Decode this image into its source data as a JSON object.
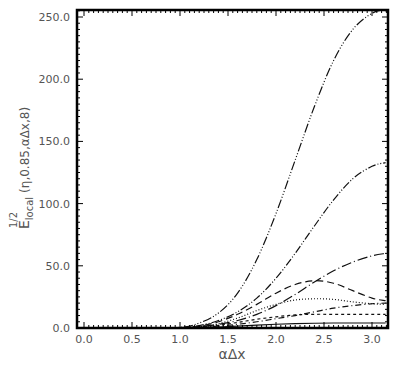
{
  "chart_data": {
    "type": "line",
    "title": "",
    "xlabel": "αΔx",
    "ylabel": {
      "base": "E",
      "superscript": "1/2",
      "subscript": "local",
      "args": "(η,0.85,αΔx,8)"
    },
    "xlim": [
      0,
      3.1416
    ],
    "ylim": [
      0,
      260
    ],
    "xticks": [
      0.0,
      0.5,
      1.0,
      1.5,
      2.0,
      2.5,
      3.0
    ],
    "xtick_labels": [
      "0.0",
      "0.5",
      "1.0",
      "1.5",
      "2.0",
      "2.5",
      "3.0"
    ],
    "yticks": [
      0,
      50,
      100,
      150,
      200,
      250
    ],
    "ytick_labels": [
      "0.0",
      "50.0",
      "100.0",
      "150.0",
      "200.0",
      "250.0"
    ],
    "grid": false,
    "legend": null,
    "x": [
      0.0,
      0.5,
      1.0,
      1.2,
      1.4,
      1.6,
      1.8,
      2.0,
      2.2,
      2.4,
      2.6,
      2.8,
      3.0,
      3.1416
    ],
    "series": [
      {
        "name": "curve-1",
        "style": "dash-dot-dot-dot",
        "values": [
          0,
          0,
          0.5,
          4,
          12,
          28,
          55,
          92,
          135,
          178,
          215,
          240,
          253,
          256
        ]
      },
      {
        "name": "curve-2",
        "style": "dash-dot-dot",
        "values": [
          0,
          0,
          0.3,
          2,
          6,
          13,
          24,
          40,
          60,
          82,
          103,
          120,
          130,
          133
        ]
      },
      {
        "name": "curve-3",
        "style": "long-dash-dot",
        "values": [
          0,
          0,
          0.2,
          1,
          3,
          6,
          11,
          18,
          27,
          37,
          46,
          53,
          58,
          60
        ]
      },
      {
        "name": "curve-4",
        "style": "dashed",
        "values": [
          0,
          0,
          0.2,
          1.5,
          5,
          11,
          19,
          28,
          35,
          38,
          36,
          30,
          24,
          22
        ]
      },
      {
        "name": "curve-5",
        "style": "dash-dot",
        "values": [
          0,
          0,
          0.1,
          0.6,
          1.5,
          3,
          5,
          7.5,
          10,
          13,
          16,
          18,
          19.5,
          20
        ]
      },
      {
        "name": "curve-6",
        "style": "dotted",
        "values": [
          0,
          0,
          0.2,
          1,
          3.5,
          8,
          14,
          19,
          22.5,
          23.5,
          23,
          21,
          19.5,
          19
        ]
      },
      {
        "name": "curve-7",
        "style": "short-dash",
        "values": [
          0,
          0,
          0.1,
          0.8,
          2.2,
          4.5,
          7,
          9,
          10.5,
          11,
          11,
          11,
          11,
          11
        ]
      },
      {
        "name": "curve-8",
        "style": "solid",
        "values": [
          0,
          0,
          0.05,
          0.3,
          0.8,
          1.5,
          2.3,
          3,
          3.5,
          3.8,
          4,
          4,
          4,
          4
        ]
      }
    ]
  }
}
